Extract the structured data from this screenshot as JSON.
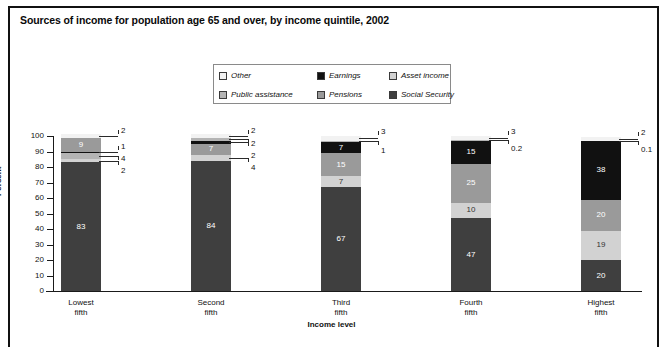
{
  "title": "Sources of income for population age 65 and over, by income quintile, 2002",
  "legend": {
    "items": [
      {
        "label": "Other",
        "color": "#f2f2f2",
        "key": "other"
      },
      {
        "label": "Earnings",
        "color": "#111111",
        "key": "earnings"
      },
      {
        "label": "Asset income",
        "color": "#d2d2d2",
        "key": "asset"
      },
      {
        "label": "Public assistance",
        "color": "#b4b4b4",
        "key": "public"
      },
      {
        "label": "Pensions",
        "color": "#9a9a9a",
        "key": "pensions"
      },
      {
        "label": "Social Security",
        "color": "#3f3f3f",
        "key": "social"
      }
    ]
  },
  "axes": {
    "ylabel": "Percent",
    "xlabel": "Income level",
    "yticks": [
      "100",
      "90",
      "80",
      "70",
      "60",
      "50",
      "40",
      "30",
      "20",
      "10",
      "0"
    ],
    "ylim": [
      0,
      100
    ],
    "categories": [
      "Lowest fifth",
      "Second fifth",
      "Third fifth",
      "Fourth fifth",
      "Highest fifth"
    ],
    "category_lines": [
      [
        "Lowest",
        "fifth"
      ],
      [
        "Second",
        "fifth"
      ],
      [
        "Third",
        "fifth"
      ],
      [
        "Fourth",
        "fifth"
      ],
      [
        "Highest",
        "fifth"
      ]
    ]
  },
  "footnote": "",
  "chart_data": {
    "type": "bar",
    "subtype": "stacked-vertical",
    "title": "Sources of income for population age 65 and over, by income quintile, 2002",
    "xlabel": "Income level",
    "ylabel": "Percent",
    "ylim": [
      0,
      100
    ],
    "grid": false,
    "legend_position": "top-center",
    "categories": [
      "Lowest fifth",
      "Second fifth",
      "Third fifth",
      "Fourth fifth",
      "Highest fifth"
    ],
    "series": [
      {
        "name": "Social Security",
        "color": "#3f3f3f",
        "values": [
          83,
          84,
          67,
          47,
          20
        ],
        "labels": [
          "83",
          "84",
          "67",
          "47",
          "20"
        ]
      },
      {
        "name": "Asset income",
        "color": "#d2d2d2",
        "values": [
          2,
          4,
          7,
          10,
          19
        ],
        "labels": [
          "2",
          "4",
          "7",
          "10",
          "19"
        ]
      },
      {
        "name": "Pensions",
        "color": "#9a9a9a",
        "values": [
          9,
          7,
          15,
          25,
          20
        ],
        "labels": [
          "9",
          "7",
          "15",
          "25",
          "20"
        ]
      },
      {
        "name": "Earnings",
        "color": "#111111",
        "values": [
          1,
          2,
          7,
          15,
          38
        ],
        "labels": [
          "1",
          "2",
          "7",
          "15",
          "38"
        ]
      },
      {
        "name": "Public assistance",
        "color": "#b4b4b4",
        "values": [
          4,
          2,
          1,
          0.2,
          0.1
        ],
        "labels": [
          "4",
          "2",
          "1",
          "0.2",
          "0.1"
        ]
      },
      {
        "name": "Other",
        "color": "#f2f2f2",
        "values": [
          2,
          2,
          3,
          3,
          2
        ],
        "labels": [
          "2",
          "2",
          "3",
          "3",
          "2"
        ]
      }
    ]
  },
  "bars": [
    {
      "category": "Lowest fifth",
      "segments": [
        {
          "series": "Social Security",
          "value": 83,
          "label": "83",
          "inside": true,
          "color": "#3f3f3f",
          "text": "#ffffff"
        },
        {
          "series": "Asset income",
          "value": 2,
          "label": "2",
          "inside": false,
          "color": "#d2d2d2"
        },
        {
          "series": "Public assistance",
          "value": 4,
          "label": "4",
          "inside": false,
          "color": "#b4b4b4"
        },
        {
          "series": "Earnings",
          "value": 1,
          "label": "1",
          "inside": false,
          "color": "#111111"
        },
        {
          "series": "Pensions",
          "value": 9,
          "label": "9",
          "inside": true,
          "color": "#9a9a9a",
          "text": "#ffffff"
        },
        {
          "series": "Other",
          "value": 2,
          "label": "2",
          "inside": false,
          "color": "#f2f2f2"
        }
      ]
    },
    {
      "category": "Second fifth",
      "segments": [
        {
          "series": "Social Security",
          "value": 84,
          "label": "84",
          "inside": true,
          "color": "#3f3f3f",
          "text": "#ffffff"
        },
        {
          "series": "Asset income",
          "value": 4,
          "label": "4",
          "inside": false,
          "color": "#d2d2d2"
        },
        {
          "series": "Pensions",
          "value": 7,
          "label": "7",
          "inside": true,
          "color": "#9a9a9a",
          "text": "#ffffff"
        },
        {
          "series": "Earnings",
          "value": 2,
          "label": "2",
          "inside": false,
          "color": "#111111"
        },
        {
          "series": "Public assistance",
          "value": 2,
          "label": "2",
          "inside": false,
          "color": "#b4b4b4"
        },
        {
          "series": "Other",
          "value": 2,
          "label": "2",
          "inside": false,
          "color": "#f2f2f2"
        }
      ]
    },
    {
      "category": "Third fifth",
      "segments": [
        {
          "series": "Social Security",
          "value": 67,
          "label": "67",
          "inside": true,
          "color": "#3f3f3f",
          "text": "#ffffff"
        },
        {
          "series": "Asset income",
          "value": 7,
          "label": "7",
          "inside": true,
          "color": "#d2d2d2",
          "text": "#333333"
        },
        {
          "series": "Pensions",
          "value": 15,
          "label": "15",
          "inside": true,
          "color": "#9a9a9a",
          "text": "#ffffff"
        },
        {
          "series": "Earnings",
          "value": 7,
          "label": "7",
          "inside": true,
          "color": "#111111",
          "text": "#ffffff"
        },
        {
          "series": "Public assistance",
          "value": 1,
          "label": "1",
          "inside": false,
          "color": "#b4b4b4"
        },
        {
          "series": "Other",
          "value": 3,
          "label": "3",
          "inside": false,
          "color": "#f2f2f2"
        }
      ]
    },
    {
      "category": "Fourth fifth",
      "segments": [
        {
          "series": "Social Security",
          "value": 47,
          "label": "47",
          "inside": true,
          "color": "#3f3f3f",
          "text": "#ffffff"
        },
        {
          "series": "Asset income",
          "value": 10,
          "label": "10",
          "inside": true,
          "color": "#d2d2d2",
          "text": "#333333"
        },
        {
          "series": "Pensions",
          "value": 25,
          "label": "25",
          "inside": true,
          "color": "#9a9a9a",
          "text": "#ffffff"
        },
        {
          "series": "Earnings",
          "value": 15,
          "label": "15",
          "inside": true,
          "color": "#111111",
          "text": "#ffffff"
        },
        {
          "series": "Public assistance",
          "value": 0.2,
          "label": "0.2",
          "inside": false,
          "color": "#b4b4b4"
        },
        {
          "series": "Other",
          "value": 3,
          "label": "3",
          "inside": false,
          "color": "#f2f2f2"
        }
      ]
    },
    {
      "category": "Highest fifth",
      "segments": [
        {
          "series": "Social Security",
          "value": 20,
          "label": "20",
          "inside": true,
          "color": "#3f3f3f",
          "text": "#ffffff"
        },
        {
          "series": "Asset income",
          "value": 19,
          "label": "19",
          "inside": true,
          "color": "#d2d2d2",
          "text": "#333333"
        },
        {
          "series": "Pensions",
          "value": 20,
          "label": "20",
          "inside": true,
          "color": "#9a9a9a",
          "text": "#ffffff"
        },
        {
          "series": "Earnings",
          "value": 38,
          "label": "38",
          "inside": true,
          "color": "#111111",
          "text": "#ffffff"
        },
        {
          "series": "Public assistance",
          "value": 0.1,
          "label": "0.1",
          "inside": false,
          "color": "#b4b4b4"
        },
        {
          "series": "Other",
          "value": 2,
          "label": "2",
          "inside": false,
          "color": "#f2f2f2"
        }
      ]
    }
  ],
  "callouts": [
    {
      "bar": 0,
      "labels": [
        "2",
        "1",
        "4",
        "2"
      ]
    },
    {
      "bar": 1,
      "labels": [
        "2",
        "2",
        "2",
        "4"
      ]
    },
    {
      "bar": 2,
      "labels": [
        "3",
        "1"
      ]
    },
    {
      "bar": 3,
      "labels": [
        "0.2",
        "3"
      ]
    },
    {
      "bar": 4,
      "labels": [
        "2",
        "0.1"
      ]
    }
  ]
}
